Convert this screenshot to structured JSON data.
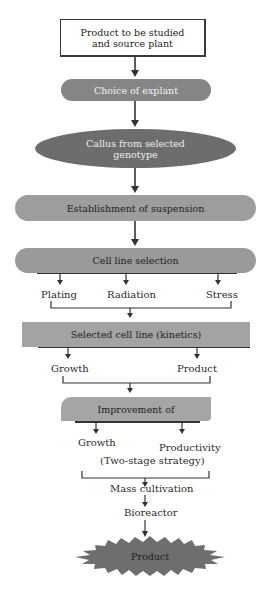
{
  "diagram": {
    "type": "flowchart",
    "colors": {
      "box_fill": "#ffffff",
      "box_border": "#3a3a3a",
      "pill_fill": "#8a8a8a",
      "ellipse_fill": "#6f6f6f",
      "light_pill_fill": "#9c9c9c",
      "rect_fill": "#a3a3a3",
      "starburst_fill": "#707070",
      "line": "#333333",
      "light_text": "#f0f0f0",
      "dark_text": "#222222"
    },
    "nodes": {
      "source": {
        "label_line1": "Product to be studied",
        "label_line2": "and source plant"
      },
      "explant": {
        "label": "Choice of explant"
      },
      "callus": {
        "label_line1": "Callus from selected",
        "label_line2": "genotype"
      },
      "suspension": {
        "label": "Establishment of suspension"
      },
      "cell_line_selection": {
        "label": "Cell line selection"
      },
      "selection_methods": {
        "plating": "Plating",
        "radiation": "Radiation",
        "stress": "Stress"
      },
      "selected_cell_line": {
        "label": "Selected cell line (kinetics)"
      },
      "kinetics_branches": {
        "growth": "Growth",
        "product": "Product"
      },
      "improvement": {
        "label": "Improvement of"
      },
      "improvement_branches": {
        "growth": "Growth",
        "productivity": "Productivity"
      },
      "strategy": {
        "label": "(Two-stage strategy)"
      },
      "mass_cultivation": {
        "label": "Mass cultivation"
      },
      "bioreactor": {
        "label": "Bioreactor"
      },
      "final_product": {
        "label": "Product"
      }
    }
  }
}
